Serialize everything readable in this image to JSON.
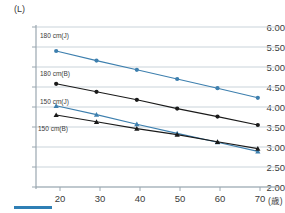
{
  "axes": {
    "y_unit_label": "(L)",
    "x_unit_label": "(歳)",
    "y_ticks": [
      "6.00",
      "5.50",
      "5.00",
      "4.50",
      "4.00",
      "3.50",
      "3.00",
      "2.50",
      "2.00"
    ],
    "x_ticks": [
      "20",
      "30",
      "40",
      "50",
      "60",
      "70"
    ]
  },
  "labels": {
    "s180j": "180 cm(J)",
    "s180b": "180 cm(B)",
    "s150j": "150 cm(J)",
    "s150b": "150 cm(B)"
  },
  "colors": {
    "blue": "#3d7fae",
    "black": "#1a1a1a",
    "grid": "#c9d3da",
    "axis": "#9aa7b0",
    "text": "#3a3a3a",
    "accent_bar": "#2f7fb5"
  },
  "chart_data": {
    "type": "line",
    "title": "",
    "xlabel": "(歳)",
    "ylabel": "(L)",
    "x": [
      20,
      30,
      40,
      50,
      60,
      70
    ],
    "xlim": [
      15,
      75
    ],
    "ylim": [
      2.0,
      6.0
    ],
    "grid": true,
    "legend": "inline-labels",
    "series": [
      {
        "name": "180 cm(J)",
        "color": "#3d7fae",
        "marker": "circle",
        "values": [
          5.4,
          5.16,
          4.93,
          4.7,
          4.47,
          4.23
        ]
      },
      {
        "name": "180 cm(B)",
        "color": "#1a1a1a",
        "marker": "circle",
        "values": [
          4.58,
          4.38,
          4.18,
          3.96,
          3.76,
          3.55
        ]
      },
      {
        "name": "150 cm(J)",
        "color": "#3d7fae",
        "marker": "triangle",
        "values": [
          4.03,
          3.81,
          3.57,
          3.34,
          3.12,
          2.89
        ]
      },
      {
        "name": "150 cm(B)",
        "color": "#1a1a1a",
        "marker": "triangle",
        "values": [
          3.8,
          3.63,
          3.46,
          3.31,
          3.13,
          2.96
        ]
      }
    ]
  }
}
